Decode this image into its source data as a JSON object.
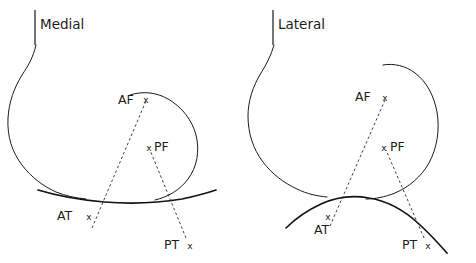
{
  "figure": {
    "width": 476,
    "height": 263,
    "background_color": "#ffffff",
    "stroke_color": "#1a1a1a",
    "dash_color": "#2b2b2b",
    "type": "anatomical-contour-diagram"
  },
  "panels": [
    {
      "id": "medial",
      "title": "Medial",
      "title_x": 40,
      "title_y": 29,
      "tick_x": 35,
      "tick_y1": 10,
      "tick_y2": 45,
      "points": [
        {
          "key": "AF",
          "label": "AF",
          "marker": "x",
          "label_x": 118,
          "label_y": 104,
          "marker_x": 146,
          "marker_y": 100
        },
        {
          "key": "PF",
          "label": "PF",
          "marker": "x",
          "label_x": 154,
          "label_y": 151,
          "marker_x": 149,
          "marker_y": 148
        },
        {
          "key": "AT",
          "label": "AT",
          "marker": "x",
          "label_x": 57,
          "label_y": 220,
          "marker_x": 89,
          "marker_y": 217
        },
        {
          "key": "PT",
          "label": "PT",
          "marker": "x",
          "label_x": 164,
          "label_y": 249,
          "marker_x": 190,
          "marker_y": 246
        }
      ],
      "ligaments": [
        {
          "key": "ACL",
          "from": "AT",
          "to": "AF"
        },
        {
          "key": "PCL",
          "from": "PT",
          "to": "PF"
        }
      ]
    },
    {
      "id": "lateral",
      "title": "Lateral",
      "title_x": 278,
      "title_y": 29,
      "tick_x": 273,
      "tick_y1": 10,
      "tick_y2": 45,
      "points": [
        {
          "key": "AF",
          "label": "AF",
          "marker": "x",
          "label_x": 355,
          "label_y": 101,
          "marker_x": 385,
          "marker_y": 98
        },
        {
          "key": "PF",
          "label": "PF",
          "marker": "x",
          "label_x": 390,
          "label_y": 151,
          "marker_x": 384,
          "marker_y": 148
        },
        {
          "key": "AT",
          "label": "AT",
          "marker": "x",
          "label_x": 314,
          "label_y": 234,
          "marker_x": 328,
          "marker_y": 217
        },
        {
          "key": "PT",
          "label": "PT",
          "marker": "x",
          "label_x": 402,
          "label_y": 249,
          "marker_x": 428,
          "marker_y": 246
        }
      ],
      "ligaments": [
        {
          "key": "ACL",
          "from": "AT",
          "to": "AF"
        },
        {
          "key": "PCL",
          "from": "PT",
          "to": "PF"
        }
      ]
    }
  ],
  "legend": {
    "abbreviations": [
      {
        "code": "AF",
        "meaning": "Anterior Femoral attachment"
      },
      {
        "code": "PF",
        "meaning": "Posterior Femoral attachment"
      },
      {
        "code": "AT",
        "meaning": "Anterior Tibial attachment"
      },
      {
        "code": "PT",
        "meaning": "Posterior Tibial attachment"
      }
    ]
  }
}
